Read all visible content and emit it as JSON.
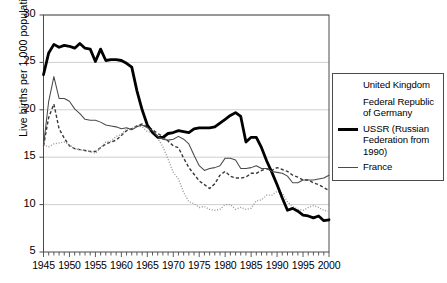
{
  "chart_data": {
    "type": "line",
    "title": "",
    "xlabel": "",
    "ylabel": "Live births per 1,000 population",
    "xlim": [
      1945,
      2000
    ],
    "ylim": [
      5,
      30
    ],
    "yticks": [
      5,
      10,
      15,
      20,
      25,
      30
    ],
    "xticks": [
      1945,
      1950,
      1955,
      1960,
      1965,
      1970,
      1975,
      1980,
      1985,
      1990,
      1995,
      2000
    ],
    "grid": "horizontal",
    "minor_xticks_every": 1,
    "legend_position": "right",
    "x": [
      1945,
      1946,
      1947,
      1948,
      1949,
      1950,
      1951,
      1952,
      1953,
      1954,
      1955,
      1956,
      1957,
      1958,
      1959,
      1960,
      1961,
      1962,
      1963,
      1964,
      1965,
      1966,
      1967,
      1968,
      1969,
      1970,
      1971,
      1972,
      1973,
      1974,
      1975,
      1976,
      1977,
      1978,
      1979,
      1980,
      1981,
      1982,
      1983,
      1984,
      1985,
      1986,
      1987,
      1988,
      1989,
      1990,
      1991,
      1992,
      1993,
      1994,
      1995,
      1996,
      1997,
      1998,
      1999,
      2000
    ],
    "series": [
      {
        "name": "United Kingdom",
        "style": "dashed",
        "color": "#3a3a3a",
        "values": [
          16.2,
          19.2,
          20.6,
          18.0,
          17.0,
          16.2,
          15.9,
          15.8,
          15.7,
          15.6,
          15.6,
          16.0,
          16.4,
          16.6,
          16.8,
          17.3,
          17.8,
          18.0,
          18.3,
          18.5,
          18.2,
          17.9,
          17.5,
          17.2,
          16.7,
          16.2,
          16.0,
          14.9,
          13.9,
          13.2,
          12.5,
          12.1,
          11.7,
          12.2,
          13.1,
          13.5,
          13.0,
          12.8,
          12.8,
          12.9,
          13.3,
          13.3,
          13.6,
          13.8,
          13.6,
          13.9,
          13.7,
          13.5,
          13.1,
          12.9,
          12.6,
          12.6,
          12.3,
          12.1,
          11.8,
          11.5
        ]
      },
      {
        "name": "Federal Republic of Germany",
        "style": "dotted",
        "color": "#9a9a9a",
        "values": [
          16.3,
          16.1,
          16.4,
          16.5,
          16.6,
          16.3,
          15.9,
          15.8,
          15.7,
          15.6,
          15.4,
          16.0,
          16.6,
          16.7,
          17.2,
          17.4,
          18.0,
          18.0,
          18.3,
          18.2,
          17.7,
          17.6,
          17.0,
          16.1,
          14.8,
          13.4,
          12.7,
          11.3,
          10.3,
          10.1,
          9.7,
          9.8,
          9.5,
          9.4,
          9.5,
          10.0,
          10.0,
          9.5,
          9.7,
          9.5,
          9.6,
          10.4,
          10.5,
          11.0,
          11.0,
          11.4,
          11.2,
          10.3,
          9.8,
          9.5,
          9.4,
          9.7,
          9.9,
          9.7,
          9.4,
          9.3
        ]
      },
      {
        "name": "USSR (Russian Federation from 1990)",
        "style": "thick",
        "color": "#000000",
        "values": [
          23.7,
          26.0,
          26.9,
          26.6,
          26.8,
          26.7,
          26.5,
          27.0,
          26.5,
          26.4,
          25.1,
          26.4,
          25.2,
          25.3,
          25.3,
          25.2,
          24.9,
          24.5,
          22.0,
          20.0,
          18.4,
          17.6,
          17.1,
          17.1,
          17.5,
          17.6,
          17.8,
          17.7,
          17.6,
          18.0,
          18.1,
          18.1,
          18.1,
          18.2,
          18.6,
          19.0,
          19.4,
          19.7,
          19.3,
          16.6,
          17.1,
          17.1,
          16.0,
          14.6,
          13.4,
          12.1,
          10.7,
          9.4,
          9.6,
          9.3,
          8.9,
          8.8,
          8.6,
          8.8,
          8.3,
          8.4
        ]
      },
      {
        "name": "France",
        "style": "thin",
        "color": "#4a4a4a",
        "values": [
          16.2,
          20.9,
          23.5,
          21.2,
          21.2,
          20.9,
          20.1,
          19.6,
          19.0,
          18.9,
          18.9,
          18.7,
          18.4,
          18.3,
          18.2,
          18.0,
          18.1,
          17.9,
          18.2,
          18.4,
          18.1,
          17.8,
          17.2,
          16.9,
          16.8,
          16.9,
          17.2,
          16.9,
          16.4,
          15.2,
          14.1,
          13.6,
          13.8,
          13.9,
          14.1,
          14.9,
          14.9,
          14.7,
          13.8,
          13.8,
          13.9,
          14.1,
          13.8,
          13.8,
          13.5,
          13.4,
          13.3,
          13.0,
          12.3,
          12.3,
          12.6,
          12.6,
          12.6,
          12.7,
          12.8,
          13.1
        ]
      }
    ]
  },
  "axes": {
    "ylabel": "Live births per 1,000 population",
    "ytick_labels": [
      "30",
      "25",
      "20",
      "15",
      "10",
      "5"
    ],
    "xtick_labels": [
      "1945",
      "1950",
      "1955",
      "1960",
      "1965",
      "1970",
      "1975",
      "1980",
      "1985",
      "1990",
      "1995",
      "2000"
    ]
  },
  "legend": {
    "items": [
      {
        "label": "United Kingdom",
        "style": "dashed"
      },
      {
        "label": "Federal Republic of Germany",
        "style": "dotted"
      },
      {
        "label": "USSR (Russian Federation from 1990)",
        "style": "thick"
      },
      {
        "label": "France",
        "style": "thin"
      }
    ]
  },
  "colors": {
    "frame": "#4a4a4a",
    "grid": "#c9c9c9",
    "uk": "#3a3a3a",
    "germany": "#9a9a9a",
    "ussr": "#000000",
    "france": "#4a4a4a"
  }
}
